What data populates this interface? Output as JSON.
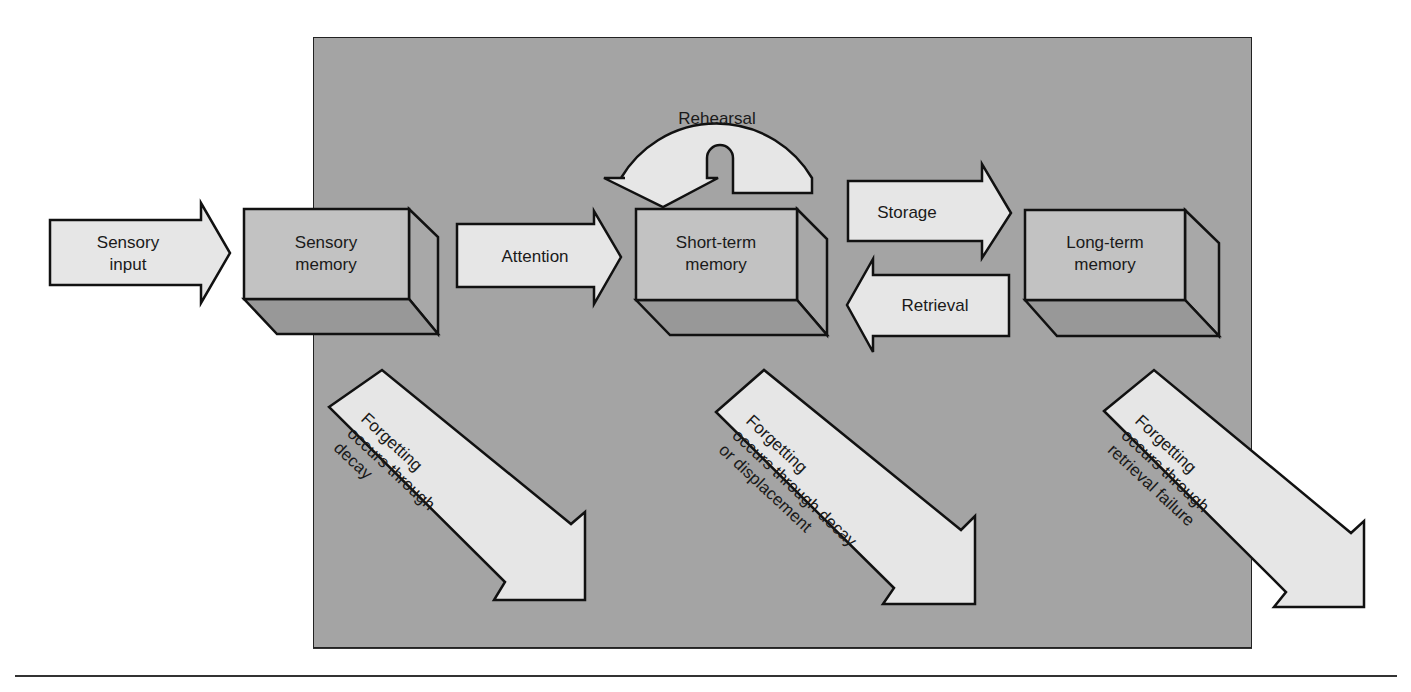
{
  "colors": {
    "panel": "#a4a4a4",
    "arrow_fill": "#e6e6e6",
    "box_front": "#c2c2c2",
    "box_side": "#a8a8a8",
    "box_bottom": "#989898",
    "stroke": "#111111",
    "rule": "#333333"
  },
  "nodes": {
    "sensory_memory": {
      "line1": "Sensory",
      "line2": "memory"
    },
    "short_term_memory": {
      "line1": "Short-term",
      "line2": "memory"
    },
    "long_term_memory": {
      "line1": "Long-term",
      "line2": "memory"
    }
  },
  "arrows": {
    "sensory_input": {
      "line1": "Sensory",
      "line2": "input"
    },
    "attention": {
      "label": "Attention"
    },
    "rehearsal": {
      "label": "Rehearsal"
    },
    "storage": {
      "label": "Storage"
    },
    "retrieval": {
      "label": "Retrieval"
    }
  },
  "forgetting": {
    "sensory": {
      "line1": "Forgetting",
      "line2": "occurs through",
      "line3": "decay"
    },
    "short_term": {
      "line1": "Forgetting",
      "line2": "occurs through decay",
      "line3": "or displacement"
    },
    "long_term": {
      "line1": "Forgetting",
      "line2": "occurs through",
      "line3": "retrieval failure"
    }
  }
}
